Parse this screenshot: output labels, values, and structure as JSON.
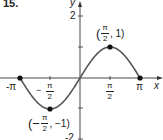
{
  "problem_number": "15.",
  "chart_data": {
    "type": "line",
    "title": "",
    "function": "y = sin(x)",
    "xlabel": "x",
    "ylabel": "y",
    "xlim": [
      -3.14159,
      3.14159
    ],
    "ylim": [
      -2,
      2
    ],
    "x_ticks": [
      "-π",
      "-π/2",
      "π/2",
      "π"
    ],
    "y_ticks": [
      "2",
      "-2"
    ],
    "series": [
      {
        "name": "sin(x)",
        "x": [
          -3.14159,
          -2.35619,
          -1.5708,
          -0.7854,
          0,
          0.7854,
          1.5708,
          2.35619,
          3.14159
        ],
        "values": [
          0,
          -0.7071,
          -1,
          -0.7071,
          0,
          0.7071,
          1,
          0.7071,
          0
        ]
      }
    ],
    "marked_points": [
      {
        "x": -3.14159,
        "y": 0,
        "label": ""
      },
      {
        "x": -1.5708,
        "y": -1,
        "label": "(-π/2, -1)"
      },
      {
        "x": 1.5708,
        "y": 1,
        "label": "(π/2, 1)"
      },
      {
        "x": 3.14159,
        "y": 0,
        "label": ""
      }
    ],
    "grid": false,
    "legend": "none"
  },
  "labels": {
    "x_axis": "x",
    "y_axis": "y",
    "y_tick_2": "2",
    "y_tick_neg2": "-2",
    "x_tick_neg_pi": "-π",
    "x_tick_pi": "π",
    "pi": "π",
    "two": "2",
    "minus": "−",
    "point_max": "(π/2, 1)",
    "point_min": "(-π/2, -1)",
    "point_max_y": ", 1)",
    "point_min_y": ", −1)",
    "open_paren": "(",
    "open_paren_neg": "(−"
  },
  "colors": {
    "curve": "#555555",
    "axes": "#333333",
    "points": "#111111"
  }
}
